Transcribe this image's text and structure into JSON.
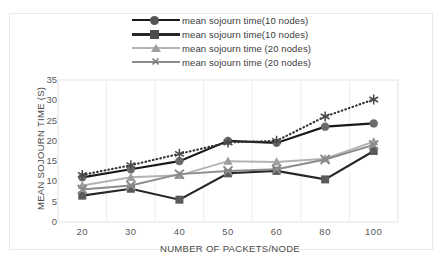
{
  "chart_data": {
    "type": "line",
    "title": "",
    "xlabel": "NUMBER OF PACKETS/NODE",
    "ylabel": "MEAN SOJOURN TIME (S)",
    "categories": [
      "20",
      "30",
      "40",
      "50",
      "60",
      "80",
      "100"
    ],
    "ylim": [
      0,
      35
    ],
    "yticks": [
      "0",
      "5",
      "10",
      "15",
      "20",
      "25",
      "30",
      "35"
    ],
    "grid": "vertical",
    "legend_position": "top-center",
    "series": [
      {
        "name": "mean sojourn time(10 nodes)",
        "marker": "diamond-circle",
        "color": "#1a1a1a",
        "style": "solid",
        "values": [
          11.0,
          13.0,
          15.0,
          20.0,
          19.5,
          23.5,
          24.3
        ]
      },
      {
        "name": "mean sojourn time(10 nodes)",
        "marker": "square",
        "color": "#262626",
        "style": "solid",
        "values": [
          6.5,
          8.2,
          5.5,
          12.0,
          12.6,
          10.5,
          17.5
        ]
      },
      {
        "name": "mean sojourn time (20 nodes)",
        "marker": "triangle",
        "color": "#b3b3b3",
        "style": "solid",
        "values": [
          9.0,
          11.0,
          11.5,
          15.0,
          14.8,
          15.6,
          19.8
        ]
      },
      {
        "name": "mean sojourn time (20 nodes)",
        "marker": "cross",
        "color": "#8c8c8c",
        "style": "solid",
        "values": [
          8.0,
          9.0,
          11.8,
          12.6,
          13.0,
          15.4,
          19.0
        ]
      },
      {
        "name": "trendline",
        "marker": "asterisk",
        "color": "#333333",
        "style": "dotted",
        "values": [
          11.6,
          14.0,
          16.8,
          19.6,
          20.0,
          26.0,
          30.2
        ]
      }
    ]
  }
}
